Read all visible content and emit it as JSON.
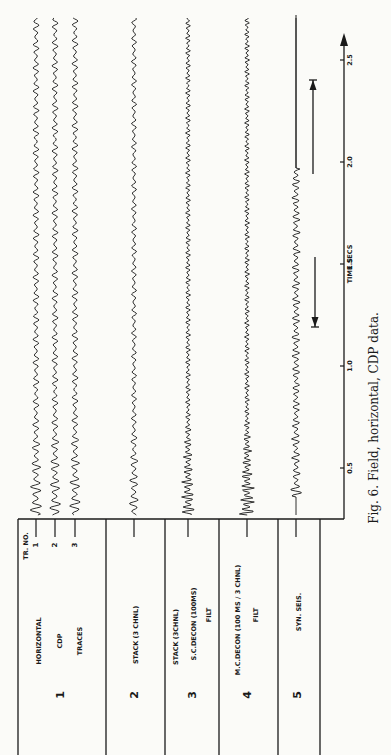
{
  "figure": {
    "caption": "Fig. 6. Field, horizontal, CDP data.",
    "orientation": "rotated 90° counter-clockwise",
    "header": {
      "tr_no_label": "TR. NO."
    },
    "axis": {
      "label": "TIME SECS",
      "ticks": [
        "0.5",
        "1.0",
        "1.5",
        "2.0",
        "2.5"
      ]
    },
    "panels": [
      {
        "number": "1",
        "lines": [
          "HORIZONTAL",
          "CDP",
          "TRACES"
        ],
        "trace_ticks": [
          "1",
          "2",
          "3"
        ]
      },
      {
        "number": "2",
        "lines": [
          "STACK (3 CHNL)"
        ]
      },
      {
        "number": "3",
        "lines": [
          "STACK (3CHNL)",
          "S.C.DECON (100MS)",
          "FILT"
        ]
      },
      {
        "number": "4",
        "lines": [
          "M.C.DECON (100 MS / 3 CHNL)",
          "FILT"
        ]
      },
      {
        "number": "5",
        "lines": [
          "SYN. SEIS."
        ]
      }
    ],
    "arrows": [
      {
        "name": "window-start-arrow",
        "from_sec": 1.85,
        "to_sec": 2.4,
        "direction": "later"
      },
      {
        "name": "window-end-arrow",
        "from_sec": 1.5,
        "to_sec": 1.2,
        "direction": "earlier"
      }
    ]
  }
}
